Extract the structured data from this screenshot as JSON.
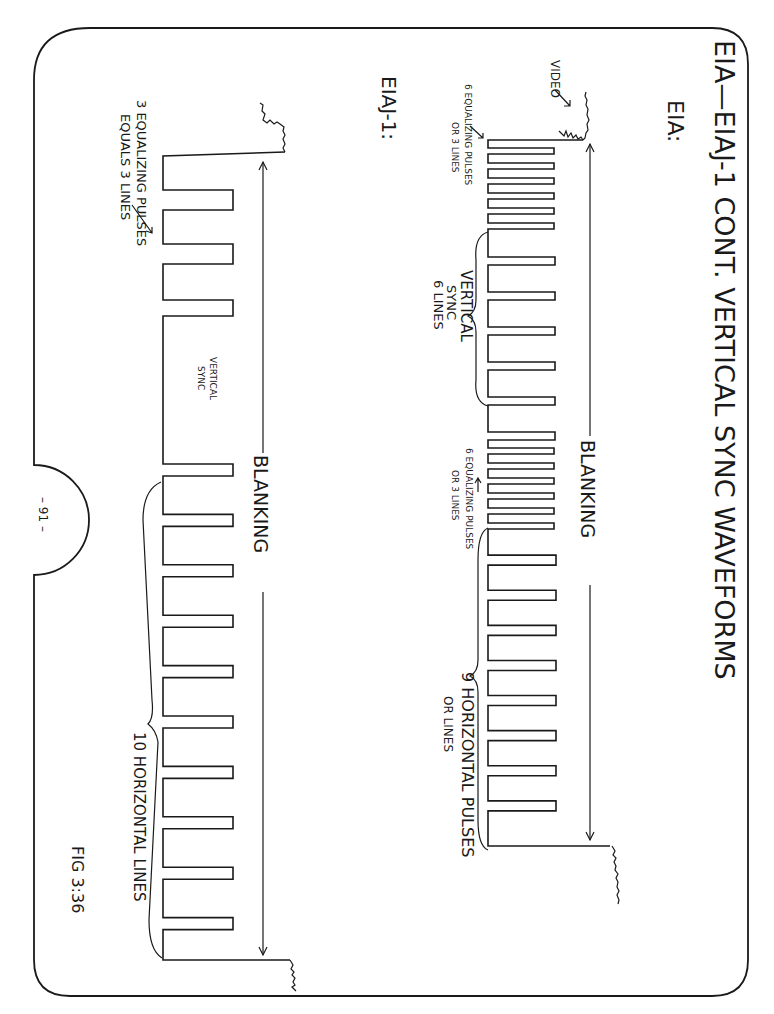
{
  "page": {
    "title": "EIA—EIAJ-1 CONT.  VERTICAL SYNC WAVEFORMS",
    "page_number": "– 91 –",
    "figure_label": "FIG 3:36",
    "orientation": "rotated 90° clockwise (landscape page)"
  },
  "eia": {
    "label": "EIA:",
    "video_label": "VIDEO",
    "blanking_label": "BLANKING",
    "pre_equalizing_note_line1": "6 EQUALIZING PULSES",
    "pre_equalizing_note_line2": "OR 3 LINES",
    "vertical_sync_line1": "VERTICAL",
    "vertical_sync_line2": "SYNC",
    "vertical_sync_line3": "6 LINES",
    "post_equalizing_note_line1": "6 EQUALIZING PULSES",
    "post_equalizing_note_line2": "OR 3 LINES",
    "horizontal_note_line1": "9 HORIZONTAL PULSES",
    "horizontal_note_line2": "OR LINES",
    "pulse_counts": {
      "pre_equalizing": 6,
      "vertical_serrations": 6,
      "post_equalizing": 6,
      "horizontal": 9
    }
  },
  "eiaj1": {
    "label": "EIAJ-1:",
    "blanking_label": "BLANKING",
    "equalizing_note_line1": "3 EQUALIZING PULSES",
    "equalizing_note_line2": "EQUALS 3 LINES",
    "vertical_sync_line1": "VERTICAL",
    "vertical_sync_line2": "SYNC",
    "horizontal_note": "10 HORIZONTAL LINES",
    "pulse_counts": {
      "equalizing": 3,
      "horizontal": 10
    }
  }
}
